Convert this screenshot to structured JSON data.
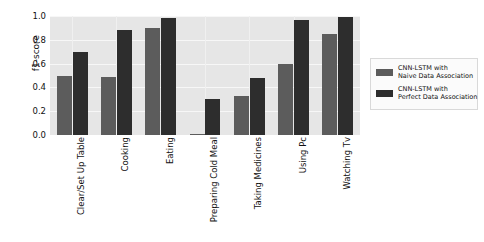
{
  "chart_data": {
    "type": "bar",
    "title": "",
    "xlabel": "",
    "ylabel": "f1-score",
    "ylim": [
      0.0,
      1.0
    ],
    "yticks": [
      "1.0",
      "0.8",
      "0.6",
      "0.4",
      "0.2",
      "0.0"
    ],
    "ytick_values": [
      1.0,
      0.8,
      0.6,
      0.4,
      0.2,
      0.0
    ],
    "grid": true,
    "legend_position": "right",
    "categories": [
      "Clear/Set Up Table",
      "Cooking",
      "Eating",
      "Preparing Cold Meal",
      "Taking Medicines",
      "Using Pc",
      "Watching Tv"
    ],
    "series": [
      {
        "name": "CNN-LSTM with Naive Data Association",
        "name_line1": "CNN-LSTM with",
        "name_line2": "Naive Data Association",
        "color": "#5c5c5c",
        "values": [
          0.5,
          0.49,
          0.9,
          0.01,
          0.33,
          0.6,
          0.85
        ]
      },
      {
        "name": "CNN-LSTM with Perfect Data Association",
        "name_line1": "CNN-LSTM with",
        "name_line2": "Perfect Data Association",
        "color": "#2d2d2d",
        "values": [
          0.7,
          0.88,
          0.98,
          0.3,
          0.48,
          0.97,
          0.99
        ]
      }
    ]
  },
  "plot_background": "#e6e6e6",
  "figure_background": "#ffffff"
}
